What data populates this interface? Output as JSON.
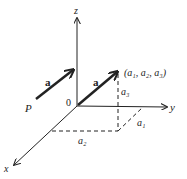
{
  "diagram": {
    "axes": {
      "x_label": "x",
      "y_label": "y",
      "z_label": "z",
      "origin_label": "0"
    },
    "free_vector": {
      "label": "a",
      "start_label": "P"
    },
    "position_vector": {
      "label": "a",
      "endpoint_label": "(a₁, a₂, a₃)"
    },
    "components": {
      "a1": "a₁",
      "a2": "a₂",
      "a3": "a₃"
    },
    "colors": {
      "line": "#222222",
      "background": "#ffffff"
    }
  }
}
